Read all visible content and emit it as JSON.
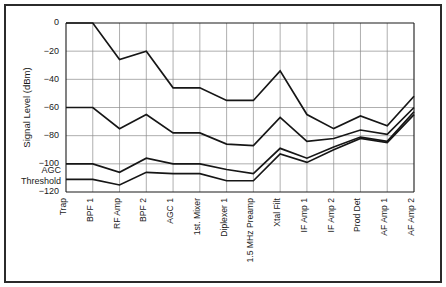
{
  "chart_data": {
    "type": "line",
    "title": "",
    "xlabel": "",
    "ylabel": "Signal Level (dBm)",
    "ylim": [
      -120,
      0
    ],
    "yticks": [
      0,
      -20,
      -40,
      -60,
      -80,
      -100,
      -120
    ],
    "ytick_labels": [
      "0",
      "-20",
      "-40",
      "-60",
      "-80",
      "-100",
      "-120"
    ],
    "grid": true,
    "legend": "none",
    "categories": [
      "Trap",
      "BPF 1",
      "RF Amp",
      "BPF 2",
      "AGC 1",
      "1st. Mixer",
      "Diplexer 1",
      "1.5 MHz Preamp",
      "Xtal Filt",
      "IF Amp 1",
      "IF Amp 2",
      "Prod Det",
      "AF Amp 1",
      "AF Amp 2"
    ],
    "series": [
      {
        "name": "Strong signal",
        "values": [
          0,
          0,
          -26,
          -20,
          -46,
          -46,
          -55,
          -55,
          -34,
          -65,
          -75,
          -66,
          -73,
          -52
        ]
      },
      {
        "name": "Medium signal",
        "values": [
          -60,
          -60,
          -75,
          -65,
          -78,
          -78,
          -86,
          -87,
          -67,
          -84,
          -82,
          -76,
          -79,
          -60
        ]
      },
      {
        "name": "Weak signal",
        "values": [
          -100,
          -100,
          -106,
          -96,
          -100,
          -100,
          -104,
          -107,
          -89,
          -96,
          -88,
          -81,
          -84,
          -63
        ]
      },
      {
        "name": "Noise floor",
        "values": [
          -111,
          -111,
          -115,
          -106,
          -107,
          -107,
          -112,
          -112,
          -93,
          -99,
          -90,
          -82,
          -85,
          -65
        ]
      }
    ],
    "annotations": [
      {
        "name": "agc-threshold",
        "line1": "AGC",
        "line2": "Threshold",
        "value": -110
      }
    ]
  }
}
